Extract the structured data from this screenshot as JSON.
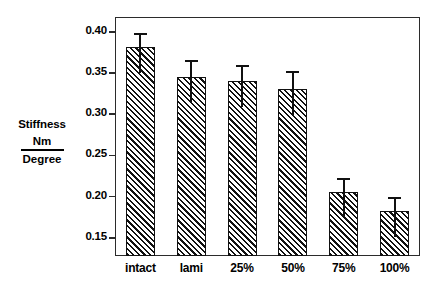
{
  "chart_data": {
    "type": "bar",
    "title": "",
    "xlabel": "",
    "ylabel": "Stiffness Nm / Degree",
    "ylabel_parts": {
      "main": "Stiffness",
      "numerator": "Nm",
      "denominator": "Degree"
    },
    "categories": [
      "intact",
      "lami",
      "25%",
      "50%",
      "75%",
      "100%"
    ],
    "values": [
      0.381,
      0.345,
      0.34,
      0.331,
      0.206,
      0.183
    ],
    "errors": [
      0.018,
      0.021,
      0.02,
      0.022,
      0.017,
      0.016
    ],
    "error_upper": [
      0.399,
      0.366,
      0.36,
      0.353,
      0.223,
      0.199
    ],
    "error_lower": [
      0.363,
      0.324,
      0.32,
      0.309,
      0.189,
      0.167
    ],
    "ylim": [
      0.128,
      0.418
    ],
    "yticks": [
      0.15,
      0.2,
      0.25,
      0.3,
      0.35,
      0.4
    ],
    "ytick_labels": [
      "0.15",
      "0.20",
      "0.25",
      "0.30",
      "0.35",
      "0.40"
    ],
    "grid": false,
    "legend": null,
    "bar_fill": "hatched-diagonal",
    "bar_edge_color": "#111111",
    "background": "#ffffff"
  },
  "axis": {
    "ytick_labels": [
      "0.40",
      "0.35",
      "0.30",
      "0.25",
      "0.20",
      "0.15"
    ],
    "xtick_labels": [
      "intact",
      "lami",
      "25%",
      "50%",
      "75%",
      "100%"
    ]
  },
  "ylabel": {
    "main": "Stiffness",
    "numerator": "Nm",
    "denominator": "Degree"
  },
  "title": {
    "text": ""
  }
}
